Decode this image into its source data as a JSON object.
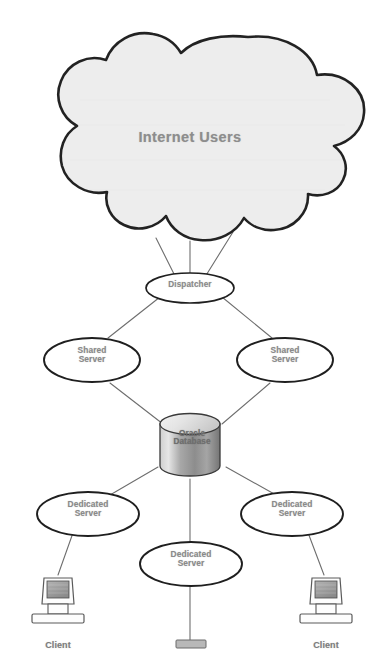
{
  "diagram": {
    "background_color": "#ffffff",
    "stroke_color": "#2b2b2b",
    "line_color": "#6e6e6e",
    "text_color": "#8a8a8a",
    "cloud_fill": "#ededed",
    "nodes": {
      "cloud": {
        "label": "Internet Users",
        "shape": "cloud",
        "fill": "#ededed",
        "stroke": "#242424"
      },
      "dispatcher": {
        "label": "Dispatcher",
        "shape": "ellipse",
        "fill": "#ffffff",
        "stroke": "#1f1f1f"
      },
      "shared_server_left": {
        "label_line1": "Shared",
        "label_line2": "Server",
        "shape": "ellipse",
        "fill": "#ffffff",
        "stroke": "#1f1f1f"
      },
      "shared_server_right": {
        "label_line1": "Shared",
        "label_line2": "Server",
        "shape": "ellipse",
        "fill": "#ffffff",
        "stroke": "#1f1f1f"
      },
      "database": {
        "label_line1": "Oracle",
        "label_line2": "Database",
        "shape": "cylinder",
        "fill_top": "#e8e8e8",
        "fill_body_light": "#d8d8d8",
        "fill_body_dark": "#8f8f8f",
        "stroke": "#3a3a3a"
      },
      "dedicated_server_left": {
        "label_line1": "Dedicated",
        "label_line2": "Server",
        "shape": "ellipse",
        "fill": "#ffffff",
        "stroke": "#1f1f1f"
      },
      "dedicated_server_center": {
        "label_line1": "Dedicated",
        "label_line2": "Server",
        "shape": "ellipse",
        "fill": "#ffffff",
        "stroke": "#1f1f1f"
      },
      "dedicated_server_right": {
        "label_line1": "Dedicated",
        "label_line2": "Server",
        "shape": "ellipse",
        "fill": "#ffffff",
        "stroke": "#1f1f1f"
      },
      "client_left": {
        "label": "Client",
        "shape": "computer",
        "screen_fill": "#9a9a9a",
        "body_fill": "#fdfdfd",
        "stroke": "#5a5a5a"
      },
      "client_center": {
        "label": "",
        "shape": "computer-cropped",
        "screen_fill": "#9a9a9a",
        "body_fill": "#fdfdfd",
        "stroke": "#5a5a5a"
      },
      "client_right": {
        "label": "Client",
        "shape": "computer",
        "screen_fill": "#9a9a9a",
        "body_fill": "#fdfdfd",
        "stroke": "#5a5a5a"
      }
    },
    "connections": [
      {
        "from": "cloud",
        "to": "dispatcher"
      },
      {
        "from": "cloud",
        "to": "dispatcher"
      },
      {
        "from": "cloud",
        "to": "dispatcher"
      },
      {
        "from": "dispatcher",
        "to": "shared_server_left"
      },
      {
        "from": "dispatcher",
        "to": "shared_server_right"
      },
      {
        "from": "shared_server_left",
        "to": "database"
      },
      {
        "from": "shared_server_right",
        "to": "database"
      },
      {
        "from": "database",
        "to": "dedicated_server_left"
      },
      {
        "from": "database",
        "to": "dedicated_server_center"
      },
      {
        "from": "database",
        "to": "dedicated_server_right"
      },
      {
        "from": "dedicated_server_left",
        "to": "client_left"
      },
      {
        "from": "dedicated_server_center",
        "to": "client_center"
      },
      {
        "from": "dedicated_server_right",
        "to": "client_right"
      }
    ]
  }
}
